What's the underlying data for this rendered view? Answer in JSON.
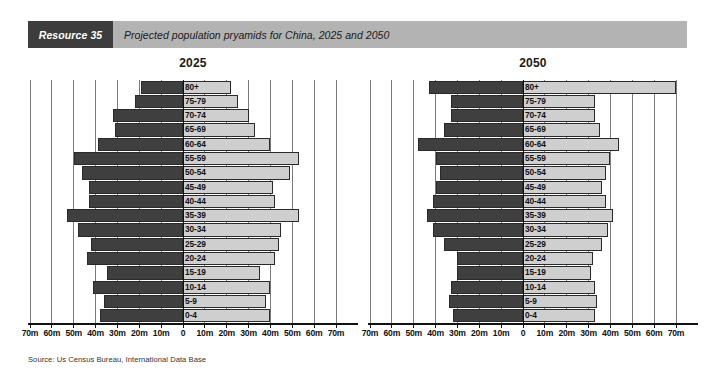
{
  "header": {
    "resource_tag": "Resource 35",
    "title": "Projected population pryamids for China, 2025 and 2050"
  },
  "source_note": "Source: Us Census Bureau, International Data Base",
  "colors": {
    "male_bar": "#3f3f3f",
    "female_bar": "#cfcfcf",
    "tag_background": "#3d3d3d",
    "banner_background": "#b3b3b3",
    "gridline": "#7a7a7a",
    "axis": "#111111"
  },
  "chart_data": [
    {
      "type": "bar",
      "title": "2025",
      "subtype": "population-pyramid",
      "xlabel": "",
      "ylabel": "",
      "xlim": [
        -70,
        70
      ],
      "axis_unit": "m",
      "grid": true,
      "legend_position": "none",
      "tick_labels": [
        "70m",
        "60m",
        "50m",
        "40m",
        "30m",
        "20m",
        "10m",
        "0",
        "10m",
        "20m",
        "30m",
        "40m",
        "50m",
        "60m",
        "70m"
      ],
      "tick_values": [
        -70,
        -60,
        -50,
        -40,
        -30,
        -20,
        -10,
        0,
        10,
        20,
        30,
        40,
        50,
        60,
        70
      ],
      "categories": [
        "0-4",
        "5-9",
        "10-14",
        "15-19",
        "20-24",
        "25-29",
        "30-34",
        "35-39",
        "40-44",
        "45-49",
        "50-54",
        "55-59",
        "60-64",
        "65-69",
        "70-74",
        "75-79",
        "80+"
      ],
      "series": [
        {
          "name": "Male",
          "values": [
            38,
            36,
            41,
            35,
            44,
            42,
            48,
            53,
            43,
            43,
            46,
            50,
            39,
            31,
            32,
            22,
            19
          ]
        },
        {
          "name": "Female",
          "values": [
            40,
            38,
            40,
            35,
            42,
            44,
            45,
            53,
            42,
            41,
            49,
            53,
            40,
            33,
            30,
            25,
            22
          ]
        }
      ]
    },
    {
      "type": "bar",
      "title": "2050",
      "subtype": "population-pyramid",
      "xlabel": "",
      "ylabel": "",
      "xlim": [
        -70,
        70
      ],
      "axis_unit": "m",
      "grid": true,
      "legend_position": "none",
      "tick_labels": [
        "70m",
        "60m",
        "50m",
        "40m",
        "30m",
        "20m",
        "10m",
        "0",
        "10m",
        "20m",
        "30m",
        "40m",
        "50m",
        "60m",
        "70m"
      ],
      "tick_values": [
        -70,
        -60,
        -50,
        -40,
        -30,
        -20,
        -10,
        0,
        10,
        20,
        30,
        40,
        50,
        60,
        70
      ],
      "categories": [
        "0-4",
        "5-9",
        "10-14",
        "15-19",
        "20-24",
        "25-29",
        "30-34",
        "35-39",
        "40-44",
        "45-49",
        "50-54",
        "55-59",
        "60-64",
        "65-69",
        "70-74",
        "75-79",
        "80+"
      ],
      "series": [
        {
          "name": "Male",
          "values": [
            32,
            34,
            33,
            30,
            30,
            36,
            41,
            44,
            41,
            40,
            38,
            40,
            48,
            36,
            33,
            33,
            43
          ]
        },
        {
          "name": "Female",
          "values": [
            33,
            34,
            33,
            31,
            32,
            36,
            39,
            41,
            38,
            36,
            38,
            40,
            44,
            35,
            33,
            33,
            70
          ]
        }
      ]
    }
  ]
}
